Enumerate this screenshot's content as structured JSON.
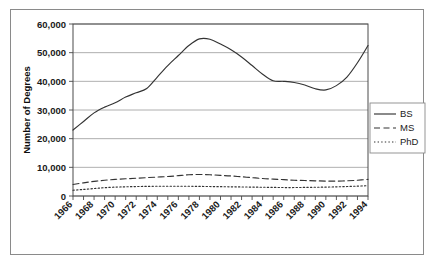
{
  "chart_data": {
    "type": "line",
    "title": "",
    "xlabel": "",
    "ylabel": "Number of Degrees",
    "ylim": [
      0,
      60000
    ],
    "ytick_labels": [
      "0",
      "10,000",
      "20,000",
      "30,000",
      "40,000",
      "50,000",
      "60,000"
    ],
    "ytick_values": [
      0,
      10000,
      20000,
      30000,
      40000,
      50000,
      60000
    ],
    "grid": true,
    "legend_position": "right",
    "x": [
      1966,
      1967,
      1968,
      1969,
      1970,
      1971,
      1972,
      1973,
      1974,
      1975,
      1976,
      1977,
      1978,
      1979,
      1980,
      1981,
      1982,
      1983,
      1984,
      1985,
      1986,
      1987,
      1988,
      1989,
      1990,
      1991,
      1992,
      1993,
      1994
    ],
    "xtick_labels": [
      "1966",
      "1968",
      "1970",
      "1972",
      "1974",
      "1976",
      "1978",
      "1980",
      "1982",
      "1984",
      "1986",
      "1988",
      "1990",
      "1992",
      "1994"
    ],
    "xtick_values": [
      1966,
      1968,
      1970,
      1972,
      1974,
      1976,
      1978,
      1980,
      1982,
      1984,
      1986,
      1988,
      1990,
      1992,
      1994
    ],
    "series": [
      {
        "name": "BS",
        "style": "solid",
        "values": [
          23000,
          26000,
          29000,
          31000,
          32500,
          34500,
          36000,
          37500,
          41500,
          45500,
          49000,
          52500,
          54800,
          54700,
          53000,
          51000,
          48500,
          45500,
          42500,
          40200,
          40000,
          39600,
          38700,
          37400,
          37000,
          38500,
          41500,
          46500,
          52500
        ]
      },
      {
        "name": "MS",
        "style": "dashed",
        "values": [
          4000,
          4600,
          5100,
          5500,
          5800,
          6000,
          6200,
          6400,
          6600,
          6800,
          7100,
          7400,
          7500,
          7400,
          7200,
          7000,
          6700,
          6400,
          6100,
          5900,
          5700,
          5500,
          5400,
          5300,
          5200,
          5200,
          5300,
          5500,
          5800
        ]
      },
      {
        "name": "PhD",
        "style": "dotted",
        "values": [
          2000,
          2300,
          2600,
          2900,
          3100,
          3200,
          3300,
          3350,
          3400,
          3400,
          3400,
          3400,
          3350,
          3300,
          3250,
          3200,
          3150,
          3100,
          3050,
          3000,
          2950,
          2950,
          3000,
          3050,
          3100,
          3200,
          3300,
          3450,
          3600
        ]
      }
    ],
    "legend": [
      {
        "label": "BS",
        "style": "solid"
      },
      {
        "label": "MS",
        "style": "dashed"
      },
      {
        "label": "PhD",
        "style": "dotted"
      }
    ],
    "colors": {
      "line": "#333333",
      "grid": "#9a9a9a",
      "axis": "#4a4a4a",
      "text": "#1a1a1a",
      "background": "#ffffff",
      "frame": "#8a8a8a"
    }
  }
}
